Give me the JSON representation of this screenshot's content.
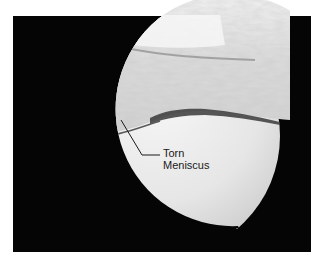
{
  "image": {
    "description": "Arthroscopic view of knee joint showing torn meniscus",
    "frame_color": "#050505",
    "background_color": "#ffffff"
  },
  "annotation": {
    "line1": "Torn",
    "line2": "Meniscus"
  }
}
